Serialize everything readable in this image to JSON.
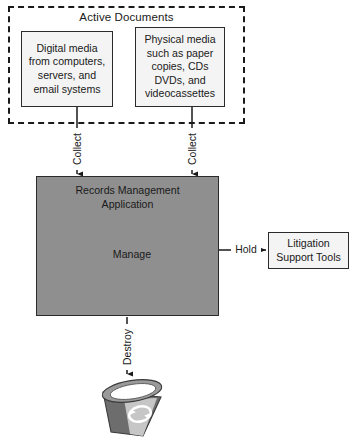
{
  "diagram": {
    "group": {
      "label": "Active Documents",
      "border_style": "dashed",
      "sources": [
        {
          "id": "digital-media",
          "label": "Digital media\nfrom computers,\nservers, and\nemail systems"
        },
        {
          "id": "physical-media",
          "label": "Physical media\nsuch as paper\ncopies, CDs\nDVDs, and\nvideocassettes"
        }
      ]
    },
    "application": {
      "title": "Records Management\nApplication",
      "fill_color": "#8f8f8f",
      "process": {
        "label": "Manage",
        "shape": "circle"
      }
    },
    "external": {
      "litigation": {
        "label": "Litigation\nSupport Tools",
        "fill_color": "#f4f4f4"
      }
    },
    "sink": {
      "id": "recycle-bin",
      "icon": "recycle-bin-icon",
      "label": ""
    },
    "edges": [
      {
        "id": "collect-left",
        "label": "Collect",
        "from": "digital-media",
        "to": "application",
        "orientation": "vertical"
      },
      {
        "id": "collect-right",
        "label": "Collect",
        "from": "physical-media",
        "to": "application",
        "orientation": "vertical"
      },
      {
        "id": "hold",
        "label": "Hold",
        "from": "application",
        "to": "litigation",
        "orientation": "horizontal"
      },
      {
        "id": "destroy",
        "label": "Destroy",
        "from": "application",
        "to": "recycle-bin",
        "orientation": "vertical"
      }
    ],
    "colors": {
      "line": "#1a1a1a",
      "box_fill": "#f4f4f4",
      "app_fill": "#8f8f8f",
      "bin_body": "#6f6f6f",
      "bin_panel": "#c9c9c9"
    }
  }
}
